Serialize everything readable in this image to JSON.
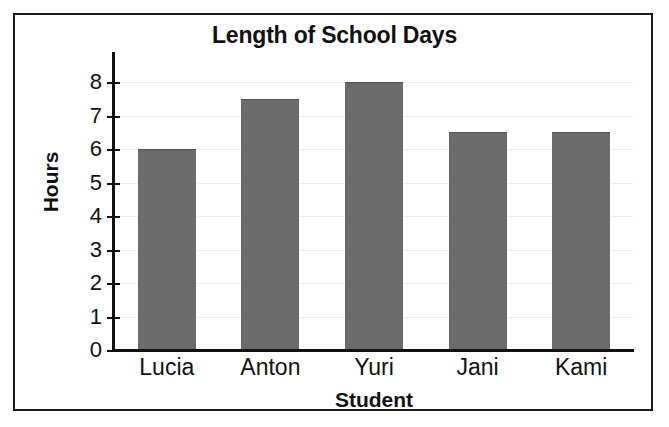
{
  "chart_data": {
    "type": "bar",
    "title": "Length of School Days",
    "xlabel": "Student",
    "ylabel": "Hours",
    "categories": [
      "Lucia",
      "Anton",
      "Yuri",
      "Jani",
      "Kami"
    ],
    "values": [
      6,
      7.5,
      8,
      6.5,
      6.5
    ],
    "ylim": [
      0,
      8
    ],
    "ytick_labels": [
      "0",
      "1",
      "2",
      "3",
      "4",
      "5",
      "6",
      "7",
      "8"
    ],
    "ytick_values": [
      0,
      1,
      2,
      3,
      4,
      5,
      6,
      7,
      8
    ],
    "grid": true,
    "legend": false,
    "bar_color": "#6b6b6b",
    "axis_color": "#111111",
    "gridline_color": "#ededed",
    "background_color": "#ffffff",
    "frame_color": "#1a1a1a"
  }
}
